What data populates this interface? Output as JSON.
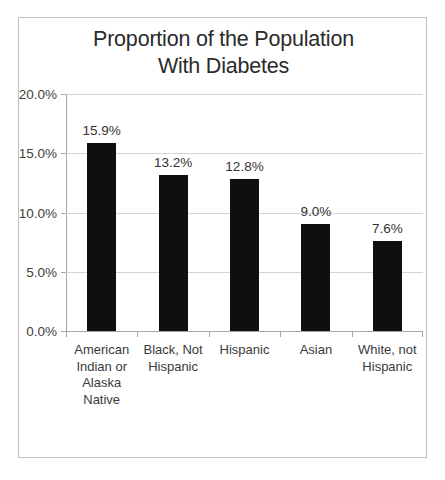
{
  "chart_data": {
    "type": "bar",
    "title": "Proportion of the Population\nWith Diabetes",
    "title_line1": "Proportion of the Population",
    "title_line2": "With Diabetes",
    "xlabel": "",
    "ylabel": "",
    "ylim": [
      0,
      20
    ],
    "ytick_values": [
      0,
      5,
      10,
      15,
      20
    ],
    "ytick_labels": [
      "0.0%",
      "5.0%",
      "10.0%",
      "15.0%",
      "20.0%"
    ],
    "grid": true,
    "legend": false,
    "bar_color": "#0f0f0f",
    "categories": [
      "American\nIndian or\nAlaska\nNative",
      "Black, Not\nHispanic",
      "Hispanic",
      "Asian",
      "White, not\nHispanic"
    ],
    "values": [
      15.9,
      13.2,
      12.8,
      9.0,
      7.6
    ],
    "data_labels": [
      "15.9%",
      "13.2%",
      "12.8%",
      "9.0%",
      "7.6%"
    ]
  }
}
